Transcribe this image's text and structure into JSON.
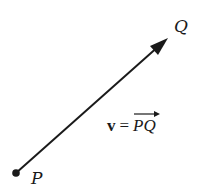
{
  "diagram": {
    "title": "",
    "points": [
      {
        "id": "P",
        "label": "P",
        "x": 16,
        "y": 173
      },
      {
        "id": "Q",
        "label": "Q",
        "x": 168,
        "y": 38
      }
    ],
    "vector": {
      "from": "P",
      "to": "Q",
      "name": "v"
    },
    "formula": {
      "lhs": "v",
      "eq": "=",
      "rhs": "PQ"
    },
    "colors": {
      "stroke": "#1a1a1a",
      "background": "#ffffff"
    }
  }
}
